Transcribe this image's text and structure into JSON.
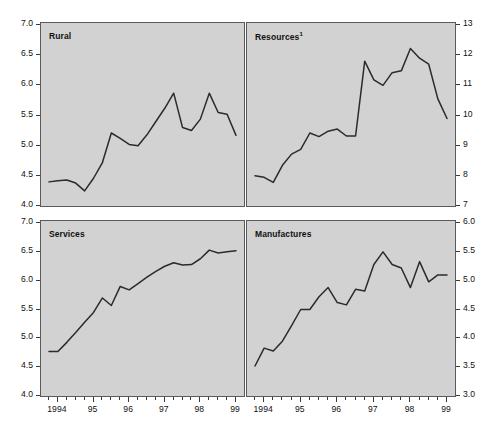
{
  "figure": {
    "panel_background": "#d2d2d2",
    "line_color": "#2b2b2b",
    "axis_color": "#5a5a5a",
    "layout": "2x2 grid of line charts sharing a 1994-99 quarterly time axis"
  },
  "chart_data": [
    {
      "type": "line",
      "title": "Rural",
      "panel": "top-left",
      "xlabel": "",
      "ylabel": "",
      "ylim": [
        4.0,
        7.0
      ],
      "yticks": [
        "4.0",
        "4.5",
        "5.0",
        "5.5",
        "6.0",
        "6.5",
        "7.0"
      ],
      "ytick_values": [
        4.0,
        4.5,
        5.0,
        5.5,
        6.0,
        6.5,
        7.0
      ],
      "axis_side": "left",
      "grid": false,
      "legend": "none",
      "xticklabels": [
        "1994",
        "95",
        "96",
        "97",
        "98",
        "99"
      ],
      "x": [
        1993.75,
        1994.0,
        1994.25,
        1994.5,
        1994.75,
        1995.0,
        1995.25,
        1995.5,
        1995.75,
        1996.0,
        1996.25,
        1996.5,
        1996.75,
        1997.0,
        1997.25,
        1997.5,
        1997.75,
        1998.0,
        1998.25,
        1998.5,
        1998.75,
        1999.0
      ],
      "values": [
        4.4,
        4.42,
        4.43,
        4.38,
        4.25,
        4.46,
        4.72,
        5.21,
        5.12,
        5.02,
        5.0,
        5.18,
        5.4,
        5.62,
        5.87,
        5.3,
        5.25,
        5.44,
        5.87,
        5.55,
        5.52,
        5.17
      ]
    },
    {
      "type": "line",
      "title": "Resources",
      "title_footnote": "1",
      "panel": "top-right",
      "xlabel": "",
      "ylabel": "",
      "ylim": [
        7,
        13
      ],
      "yticks": [
        "7",
        "8",
        "9",
        "10",
        "11",
        "12",
        "13"
      ],
      "ytick_values": [
        7,
        8,
        9,
        10,
        11,
        12,
        13
      ],
      "axis_side": "right",
      "grid": false,
      "legend": "none",
      "xticklabels": [
        "1994",
        "95",
        "96",
        "97",
        "98",
        "99"
      ],
      "x": [
        1993.75,
        1994.0,
        1994.25,
        1994.5,
        1994.75,
        1995.0,
        1995.25,
        1995.5,
        1995.75,
        1996.0,
        1996.25,
        1996.5,
        1996.75,
        1997.0,
        1997.25,
        1997.5,
        1997.75,
        1998.0,
        1998.25,
        1998.5,
        1998.75,
        1999.0
      ],
      "values": [
        8.0,
        7.95,
        7.78,
        8.35,
        8.72,
        8.88,
        9.42,
        9.3,
        9.48,
        9.55,
        9.32,
        9.32,
        11.8,
        11.18,
        11.0,
        11.42,
        11.48,
        12.22,
        11.9,
        11.7,
        10.55,
        9.9
      ]
    },
    {
      "type": "line",
      "title": "Services",
      "panel": "bottom-left",
      "xlabel": "",
      "ylabel": "",
      "ylim": [
        4.0,
        7.0
      ],
      "yticks": [
        "4.0",
        "4.5",
        "5.0",
        "5.5",
        "6.0",
        "6.5",
        "7.0"
      ],
      "ytick_values": [
        4.0,
        4.5,
        5.0,
        5.5,
        6.0,
        6.5,
        7.0
      ],
      "axis_side": "left",
      "grid": false,
      "legend": "none",
      "xticklabels": [
        "1994",
        "95",
        "96",
        "97",
        "98",
        "99"
      ],
      "x": [
        1993.75,
        1994.0,
        1994.25,
        1994.5,
        1994.75,
        1995.0,
        1995.25,
        1995.5,
        1995.75,
        1996.0,
        1996.25,
        1996.5,
        1996.75,
        1997.0,
        1997.25,
        1997.5,
        1997.75,
        1998.0,
        1998.25,
        1998.5,
        1998.75,
        1999.0
      ],
      "values": [
        4.77,
        4.77,
        4.93,
        5.1,
        5.28,
        5.45,
        5.7,
        5.57,
        5.9,
        5.84,
        5.95,
        6.06,
        6.16,
        6.25,
        6.31,
        6.27,
        6.28,
        6.38,
        6.53,
        6.48,
        6.5,
        6.52
      ]
    },
    {
      "type": "line",
      "title": "Manufactures",
      "panel": "bottom-right",
      "xlabel": "",
      "ylabel": "",
      "ylim": [
        3.0,
        6.0
      ],
      "yticks": [
        "3.0",
        "3.5",
        "4.0",
        "4.5",
        "5.0",
        "5.5",
        "6.0"
      ],
      "ytick_values": [
        3.0,
        3.5,
        4.0,
        4.5,
        5.0,
        5.5,
        6.0
      ],
      "axis_side": "right",
      "grid": false,
      "legend": "none",
      "xticklabels": [
        "1994",
        "95",
        "96",
        "97",
        "98",
        "99"
      ],
      "x": [
        1993.75,
        1994.0,
        1994.25,
        1994.5,
        1994.75,
        1995.0,
        1995.25,
        1995.5,
        1995.75,
        1996.0,
        1996.25,
        1996.5,
        1996.75,
        1997.0,
        1997.25,
        1997.5,
        1997.75,
        1998.0,
        1998.25,
        1998.5,
        1998.75,
        1999.0
      ],
      "values": [
        3.52,
        3.83,
        3.78,
        3.95,
        4.22,
        4.5,
        4.5,
        4.72,
        4.88,
        4.62,
        4.58,
        4.85,
        4.82,
        5.28,
        5.5,
        5.28,
        5.22,
        4.88,
        5.33,
        4.98,
        5.1,
        5.1
      ]
    }
  ]
}
